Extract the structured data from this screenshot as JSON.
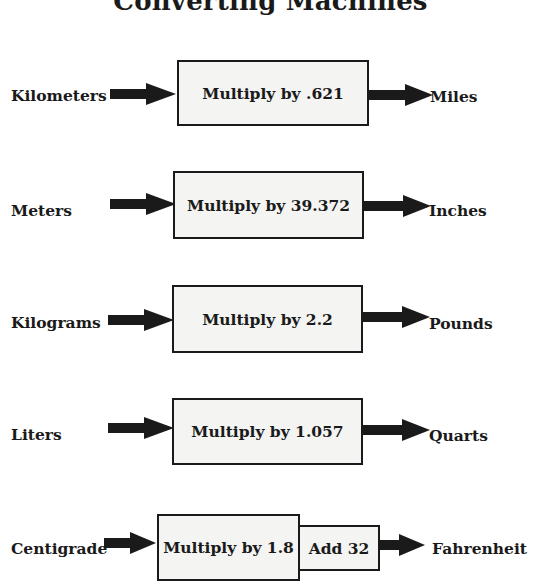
{
  "title": "Converting Machines",
  "rows": [
    {
      "input": "Kilometers",
      "operations": [
        "Multiply by .621"
      ],
      "output": "Miles"
    },
    {
      "input": "Meters",
      "operations": [
        "Multiply by 39.372"
      ],
      "output": "Inches"
    },
    {
      "input": "Kilograms",
      "operations": [
        "Multiply by 2.2"
      ],
      "output": "Pounds"
    },
    {
      "input": "Liters",
      "operations": [
        "Multiply by 1.057"
      ],
      "output": "Quarts"
    },
    {
      "input": "Centigrade",
      "operations": [
        "Multiply by 1.8",
        "Add 32"
      ],
      "output": "Fahrenheit"
    }
  ],
  "colors": {
    "stroke": "#1a1a1a",
    "box_fill": "#f4f4f2",
    "background": "#ffffff"
  }
}
